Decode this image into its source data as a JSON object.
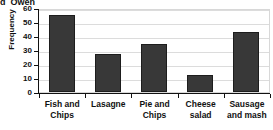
{
  "header": {
    "item_letter": "d",
    "item_name": "Owen"
  },
  "chart_data": {
    "type": "bar",
    "title": "",
    "xlabel": "",
    "ylabel": "Frequency",
    "categories": [
      "Fish and Chips",
      "Lasagne",
      "Pie and Chips",
      "Cheese salad",
      "Sausage and mash"
    ],
    "values": [
      55,
      27,
      34,
      12,
      43
    ],
    "ylim": [
      0,
      60
    ],
    "ytick_labels": [
      "60",
      "50",
      "40",
      "30",
      "20",
      "10",
      "0"
    ],
    "ytick_values": [
      60,
      50,
      40,
      30,
      20,
      10,
      0
    ],
    "ystep": 10,
    "grid": "horizontal",
    "legend": "none",
    "bar_color": "#383838",
    "bar_edge_color": "#1d1d1d",
    "gridline_color": "#dcdcdc",
    "axis_color": "#111111",
    "background_color": "#ffffff"
  }
}
